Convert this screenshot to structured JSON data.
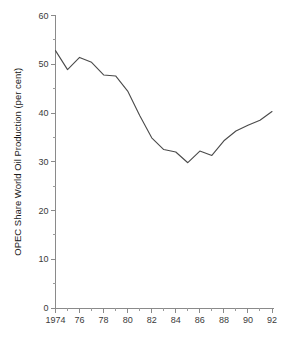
{
  "chart_data": {
    "type": "line",
    "title": "",
    "subtitle": "",
    "xlabel": "",
    "ylabel": "OPEC Share World Oil Production (per cent)",
    "xlim": [
      1974,
      1992
    ],
    "ylim": [
      0,
      60
    ],
    "grid": false,
    "legend": "none",
    "y_ticks": [
      0,
      10,
      20,
      30,
      40,
      50,
      60
    ],
    "y_tick_labels": [
      "0",
      "10",
      "20",
      "30",
      "40",
      "50",
      "60"
    ],
    "y_minor_ticks": [
      5,
      15,
      25,
      35,
      45,
      55
    ],
    "x_ticks": [
      1974,
      1976,
      1978,
      1980,
      1982,
      1984,
      1986,
      1988,
      1990,
      1992
    ],
    "x_tick_labels": [
      "1974",
      "76",
      "78",
      "80",
      "82",
      "84",
      "86",
      "88",
      "90",
      "92"
    ],
    "x_minor_ticks": [
      1975,
      1977,
      1979,
      1981,
      1983,
      1985,
      1987,
      1989,
      1991
    ],
    "x": [
      1974,
      1975,
      1976,
      1977,
      1978,
      1979,
      1980,
      1981,
      1982,
      1983,
      1984,
      1985,
      1986,
      1987,
      1988,
      1989,
      1990,
      1991,
      1992
    ],
    "values": [
      52.8,
      48.9,
      51.4,
      50.4,
      47.8,
      47.6,
      44.5,
      39.5,
      34.9,
      32.5,
      32.0,
      29.8,
      32.2,
      31.3,
      34.3,
      36.3,
      37.5,
      38.5,
      40.3
    ],
    "series": [
      {
        "name": "OPEC Share World Oil Production",
        "color": "#4a4a4a",
        "values": [
          52.8,
          48.9,
          51.4,
          50.4,
          47.8,
          47.6,
          44.5,
          39.5,
          34.9,
          32.5,
          32.0,
          29.8,
          32.2,
          31.3,
          34.3,
          36.3,
          37.5,
          38.5,
          40.3
        ]
      }
    ],
    "axis_color": "#8a8a8a",
    "text_color": "#1a1a1a"
  }
}
